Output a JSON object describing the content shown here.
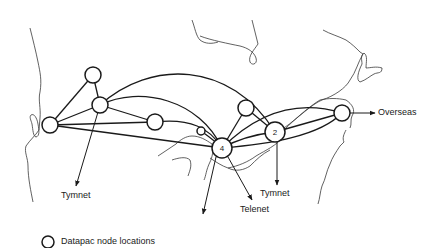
{
  "diagram": {
    "type": "network map",
    "nodes": [
      {
        "id": "n1",
        "x": 93,
        "y": 75,
        "r": 8,
        "label": ""
      },
      {
        "id": "n2",
        "x": 100,
        "y": 105,
        "r": 8,
        "label": ""
      },
      {
        "id": "n3",
        "x": 50,
        "y": 125,
        "r": 8,
        "label": ""
      },
      {
        "id": "n4",
        "x": 155,
        "y": 122,
        "r": 8,
        "label": ""
      },
      {
        "id": "n5",
        "x": 201,
        "y": 131,
        "r": 4,
        "label": ""
      },
      {
        "id": "n6",
        "x": 222,
        "y": 148,
        "r": 10,
        "label": "4"
      },
      {
        "id": "n7",
        "x": 246,
        "y": 108,
        "r": 8,
        "label": ""
      },
      {
        "id": "n8",
        "x": 275,
        "y": 132,
        "r": 10,
        "label": "2"
      },
      {
        "id": "n9",
        "x": 342,
        "y": 113,
        "r": 8,
        "label": ""
      }
    ],
    "external_links": [
      {
        "label": "Tymnet",
        "from": "n2"
      },
      {
        "label": "Telenet",
        "from": "n6"
      },
      {
        "label": "Tymnet",
        "from": "n8"
      },
      {
        "label": "Overseas",
        "from": "n9"
      },
      {
        "label": "",
        "from": "n6"
      }
    ]
  },
  "labels": {
    "tymnet_west": "Tymnet",
    "telenet": "Telenet",
    "tymnet_east": "Tymnet",
    "overseas": "Overseas",
    "node_4": "4",
    "node_2": "2"
  },
  "legend": {
    "label": "Datapac node locations"
  },
  "colors": {
    "line": "#1a1a1a",
    "coast": "#3a3a3a",
    "background": "#ffffff"
  }
}
